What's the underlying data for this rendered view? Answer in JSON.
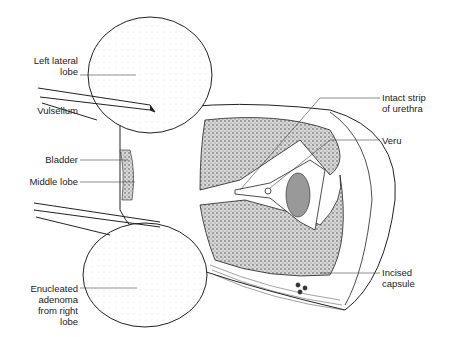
{
  "diagram": {
    "type": "anatomical-illustration",
    "labels": {
      "left_lateral_lobe": "Left lateral\nlobe",
      "vulsellum": "Vulsellum",
      "bladder": "Bladder",
      "middle_lobe": "Middle lobe",
      "enucleated_adenoma": "Enucleated\nadenoma\nfrom right\nlobe",
      "intact_strip": "Intact strip\nof urethra",
      "veru": "Veru",
      "incised_capsule": "Incised\ncapsule"
    },
    "colors": {
      "ink": "#222222",
      "stipple": "#555555",
      "background": "#ffffff"
    }
  }
}
